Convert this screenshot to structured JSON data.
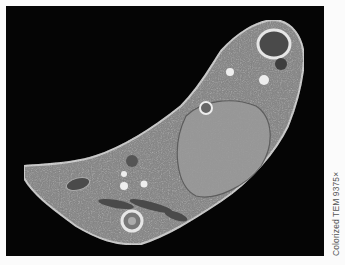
{
  "figure": {
    "caption": "Colorized TEM 9375×",
    "background_color": "#050505",
    "page_color": "#fbfbfb"
  }
}
